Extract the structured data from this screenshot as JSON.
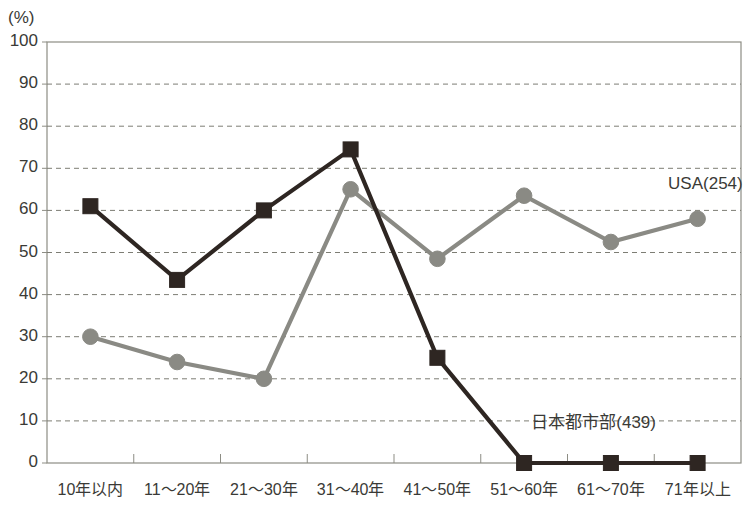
{
  "chart_data": {
    "type": "line",
    "title": "",
    "subtitle": "",
    "unit_label": "(%)",
    "xlabel": "",
    "ylabel": "",
    "ylim": [
      0,
      100
    ],
    "ytick_step": 10,
    "ytick_labels": [
      "100",
      "90",
      "80",
      "70",
      "60",
      "50",
      "40",
      "30",
      "20",
      "10",
      "0"
    ],
    "grid": true,
    "grid_style": "dashed-horizontal",
    "legend_position": "inline-annotation",
    "categories": [
      "10年以内",
      "11～20年",
      "21～30年",
      "31～40年",
      "41～50年",
      "51～60年",
      "61～70年",
      "71年以上"
    ],
    "series": [
      {
        "name": "日本都市部(439)",
        "marker": "square",
        "color": "#2e2622",
        "values": [
          61,
          43.5,
          60,
          74.5,
          25,
          0,
          0,
          0
        ],
        "annotation_text": "日本都市部(439)",
        "annotation_x_category": "61～70年",
        "annotation_value": 10.5
      },
      {
        "name": "USA(254)",
        "marker": "circle",
        "color": "#8a8a84",
        "values": [
          30,
          24,
          20,
          65,
          48.5,
          63.5,
          52.5,
          58
        ],
        "annotation_text": "USA(254)",
        "annotation_x_category": "71年以上",
        "annotation_value": 66
      }
    ]
  },
  "colors": {
    "series_japan": "#2e2622",
    "series_usa": "#8a8a84",
    "grid": "#7d7d74",
    "axis": "#8d8d84",
    "text": "#3a3a36",
    "background": "#ffffff"
  }
}
